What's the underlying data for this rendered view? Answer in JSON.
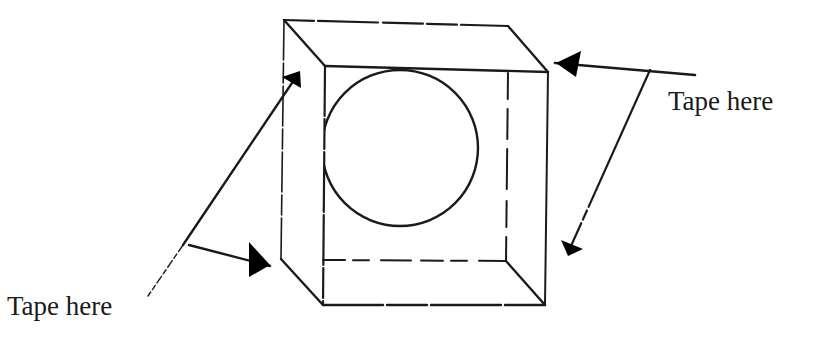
{
  "diagram": {
    "type": "line-drawing",
    "labels": {
      "right": "Tape here",
      "left": "Tape here"
    },
    "colors": {
      "ink": "#1a1a1a",
      "background": "#ffffff"
    },
    "box": {
      "back_face": {
        "tl": [
          284,
          20
        ],
        "tr": [
          508,
          26
        ],
        "br": [
          506,
          261
        ],
        "bl": [
          281,
          259
        ]
      },
      "front_face": {
        "tl": [
          325,
          66
        ],
        "tr": [
          548,
          72
        ],
        "br": [
          545,
          305
        ],
        "bl": [
          323,
          305
        ]
      },
      "hidden_edges": "dashed"
    },
    "circle": {
      "cx": 400,
      "cy": 148,
      "r": 78,
      "clipped_by": [
        "front-top-edge",
        "front-left-edge"
      ]
    },
    "arrows": [
      {
        "name": "right-arrow-upper",
        "from": [
          650,
          70
        ],
        "to": [
          555,
          63
        ]
      },
      {
        "name": "right-arrow-lower",
        "from": [
          650,
          70
        ],
        "to": [
          568,
          254
        ]
      },
      {
        "name": "left-arrow-upper",
        "from": [
          183,
          245
        ],
        "to": [
          300,
          71
        ]
      },
      {
        "name": "left-arrow-lower",
        "from": [
          183,
          245
        ],
        "to": [
          270,
          266
        ]
      }
    ]
  }
}
